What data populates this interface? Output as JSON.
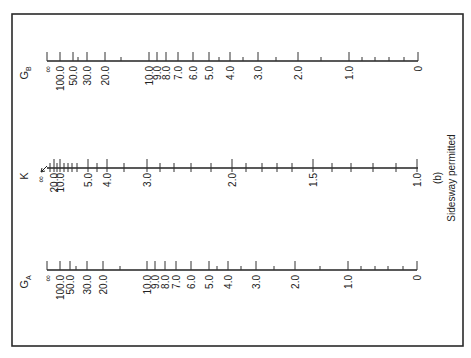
{
  "figure": {
    "caption_letter": "(b)",
    "caption_text": "Sidesway permitted",
    "frame": {
      "x": 12,
      "y": 14,
      "w": 451,
      "h": 332
    }
  },
  "scales": [
    {
      "id": "GB",
      "name": "G",
      "subscript": "B",
      "axis_y": 61,
      "x_start": 47,
      "x_end": 418,
      "major_ticks": [
        {
          "label": "∞",
          "x": 47
        },
        {
          "label": "100.0",
          "x": 60
        },
        {
          "label": "50.0",
          "x": 73
        },
        {
          "label": "30.0",
          "x": 87
        },
        {
          "label": "20.0",
          "x": 105
        },
        {
          "label": "10.0",
          "x": 149
        },
        {
          "label": "9.0",
          "x": 157
        },
        {
          "label": "8.0",
          "x": 166
        },
        {
          "label": "7.0",
          "x": 178
        },
        {
          "label": "6.0",
          "x": 193
        },
        {
          "label": "5.0",
          "x": 209
        },
        {
          "label": "4.0",
          "x": 230
        },
        {
          "label": "3.0",
          "x": 258
        },
        {
          "label": "2.0",
          "x": 298
        },
        {
          "label": "1.0",
          "x": 349
        },
        {
          "label": "0",
          "x": 418
        }
      ],
      "minor_ticks": [
        78,
        121,
        219,
        243,
        276,
        321,
        362,
        375,
        389,
        404
      ]
    },
    {
      "id": "K",
      "name": "K",
      "subscript": "",
      "axis_y": 168,
      "x_start": 47,
      "x_end": 418,
      "arrow_infinity": true,
      "major_ticks": [
        {
          "label": "∞",
          "x": 42
        },
        {
          "label": "20.0",
          "x": 54
        },
        {
          "label": "10.0",
          "x": 60
        },
        {
          "label": "5.0",
          "x": 88
        },
        {
          "label": "4.0",
          "x": 107
        },
        {
          "label": "3.0",
          "x": 147
        },
        {
          "label": "2.0",
          "x": 232
        },
        {
          "label": "1.5",
          "x": 313
        },
        {
          "label": "1.0",
          "x": 417
        }
      ],
      "minor_ticks": [
        50,
        57,
        64,
        68,
        72,
        77,
        97,
        124,
        160,
        174,
        191,
        211,
        246,
        262,
        277,
        292,
        332,
        351,
        373,
        396
      ]
    },
    {
      "id": "GA",
      "name": "G",
      "subscript": "A",
      "axis_y": 270,
      "x_start": 47,
      "x_end": 417,
      "major_ticks": [
        {
          "label": "∞",
          "x": 47
        },
        {
          "label": "100.0",
          "x": 60
        },
        {
          "label": "50.0",
          "x": 70
        },
        {
          "label": "30.0",
          "x": 87
        },
        {
          "label": "20.0",
          "x": 103
        },
        {
          "label": "10.0",
          "x": 147
        },
        {
          "label": "9.0",
          "x": 155
        },
        {
          "label": "8.0",
          "x": 165
        },
        {
          "label": "7.0",
          "x": 176
        },
        {
          "label": "6.0",
          "x": 191
        },
        {
          "label": "5.0",
          "x": 209
        },
        {
          "label": "4.0",
          "x": 228
        },
        {
          "label": "3.0",
          "x": 256
        },
        {
          "label": "2.0",
          "x": 295
        },
        {
          "label": "1.0",
          "x": 348
        },
        {
          "label": "0",
          "x": 417
        }
      ],
      "minor_ticks": [
        76,
        120,
        217,
        241,
        274,
        320,
        361,
        375,
        388,
        403
      ]
    }
  ]
}
